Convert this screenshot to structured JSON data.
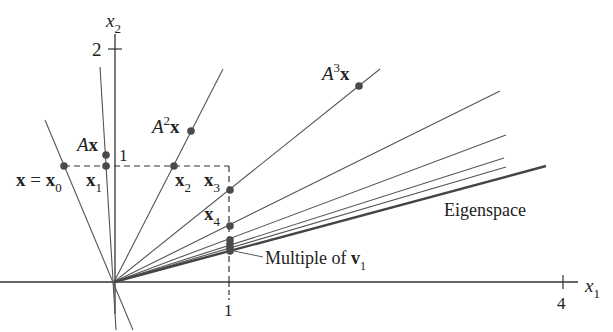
{
  "diagram": {
    "axes": {
      "x_label": "x",
      "x_label_sub": "1",
      "y_label": "x",
      "y_label_sub": "2",
      "x_ticks": [
        {
          "value": "1",
          "px": 229
        },
        {
          "value": "4",
          "px": 563
        }
      ],
      "y_ticks": [
        {
          "value": "1",
          "py": 166
        },
        {
          "value": "2",
          "py": 49
        }
      ],
      "origin_px": [
        114,
        282
      ]
    },
    "labels": {
      "x0_lhs": "x",
      "x0_eq": " = ",
      "x0_rhs": "x",
      "x0_sub": "0",
      "ax_A": "A",
      "ax_x": "x",
      "x1": "x",
      "x1_sub": "1",
      "a2x_A": "A",
      "a2x_sup": "2",
      "a2x_x": "x",
      "x2": "x",
      "x2_sub": "2",
      "x3": "x",
      "x3_sub": "3",
      "x4": "x",
      "x4_sub": "4",
      "a3x_A": "A",
      "a3x_sup": "3",
      "a3x_x": "x",
      "eigenspace": "Eigenspace",
      "multiple_text": "Multiple of ",
      "multiple_v": "v",
      "multiple_sub": "1",
      "tick_1_y": "1",
      "tick_2_y": "2",
      "tick_1_x": "1",
      "tick_4_x": "4"
    },
    "lines_from_origin": [
      {
        "name": "x0-line",
        "end": [
          45,
          120
        ],
        "through": "x0"
      },
      {
        "name": "ax-line",
        "end": [
          100,
          67
        ],
        "through": "Ax, x1"
      },
      {
        "name": "a2x-line",
        "end": [
          223,
          69
        ],
        "through": "A^2x, x2"
      },
      {
        "name": "a3x-line",
        "end": [
          380,
          69
        ],
        "through": "A^3x, x3"
      },
      {
        "name": "x4-line",
        "end": [
          500,
          91
        ]
      },
      {
        "name": "x5-line",
        "end": [
          506,
          135
        ]
      },
      {
        "name": "x6-line",
        "end": [
          504,
          158
        ]
      },
      {
        "name": "x7-line",
        "end": [
          506,
          167
        ]
      },
      {
        "name": "eigenspace-line",
        "end": [
          546,
          166
        ],
        "emphasis": true
      }
    ],
    "points": [
      {
        "name": "x0",
        "px": [
          64,
          166
        ]
      },
      {
        "name": "Ax",
        "px": [
          106,
          155
        ]
      },
      {
        "name": "x1",
        "px": [
          106,
          166
        ]
      },
      {
        "name": "A2x",
        "px": [
          191,
          131
        ]
      },
      {
        "name": "x2",
        "px": [
          174,
          166
        ]
      },
      {
        "name": "A3x",
        "px": [
          359,
          86
        ]
      },
      {
        "name": "x3",
        "px": [
          230,
          190
        ]
      },
      {
        "name": "x4",
        "px": [
          230,
          226
        ]
      },
      {
        "name": "x5",
        "px": [
          230,
          240
        ]
      },
      {
        "name": "x6",
        "px": [
          230,
          244
        ]
      },
      {
        "name": "x7",
        "px": [
          230,
          248
        ]
      },
      {
        "name": "x8",
        "px": [
          230,
          251
        ]
      }
    ],
    "colors": {
      "line": "#555555",
      "eigenspace": "#444444",
      "point": "#444444",
      "text": "#222222"
    }
  }
}
